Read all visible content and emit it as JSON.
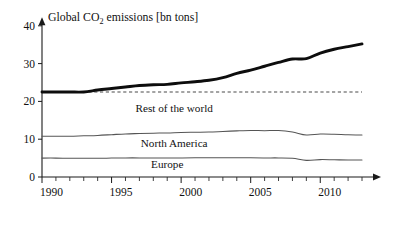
{
  "chart_data": {
    "type": "line",
    "title": "Global CO2 emissions [bn tons]",
    "title_prefix": "Global CO",
    "title_subscript": "2",
    "title_suffix": " emissions [bn tons]",
    "xlabel": "",
    "ylabel": "",
    "xlim": [
      1990,
      2013
    ],
    "ylim": [
      0,
      42
    ],
    "yticks": [
      0,
      10,
      20,
      30,
      40
    ],
    "ytick_labels": [
      "0",
      "10",
      "20",
      "30",
      "40"
    ],
    "xticks": [
      1990,
      1995,
      2000,
      2005,
      2010
    ],
    "xtick_labels": [
      "1990",
      "1995",
      "2000",
      "2005",
      "2010"
    ],
    "minor_xtick_interval": 1,
    "grid": false,
    "legend": "inline-band-labels",
    "x": [
      1990,
      1991,
      1992,
      1993,
      1994,
      1995,
      1996,
      1997,
      1998,
      1999,
      2000,
      2001,
      2002,
      2003,
      2004,
      2005,
      2006,
      2007,
      2008,
      2009,
      2010,
      2011,
      2012,
      2013
    ],
    "series": [
      {
        "name": "Global total",
        "style": "bold",
        "color": "#0d0d0d",
        "values": [
          22.5,
          22.5,
          22.5,
          22.5,
          23.0,
          23.4,
          23.8,
          24.2,
          24.4,
          24.5,
          24.9,
          25.2,
          25.6,
          26.3,
          27.4,
          28.3,
          29.3,
          30.3,
          31.2,
          31.3,
          32.8,
          33.8,
          34.5,
          35.2
        ]
      },
      {
        "name": "Rest of the world (upper boundary: North America top)",
        "style": "thin",
        "color": "#555555",
        "values": [
          10.8,
          10.8,
          10.8,
          10.9,
          11.0,
          11.2,
          11.4,
          11.5,
          11.6,
          11.65,
          11.8,
          11.85,
          11.9,
          12.05,
          12.2,
          12.3,
          12.25,
          12.3,
          11.9,
          11.1,
          11.35,
          11.3,
          11.15,
          11.1
        ]
      },
      {
        "name": "Europe (upper boundary)",
        "style": "thin",
        "color": "#555555",
        "values": [
          5.0,
          5.0,
          4.95,
          4.95,
          4.95,
          5.0,
          5.05,
          5.05,
          5.05,
          5.05,
          5.05,
          5.1,
          5.1,
          5.1,
          5.1,
          5.1,
          5.05,
          5.05,
          4.95,
          4.4,
          4.6,
          4.55,
          4.5,
          4.5
        ]
      }
    ],
    "reference_line": {
      "name": "baseline-1990",
      "value": 22.5,
      "style": "dashed",
      "color": "#4a4a4a"
    },
    "band_labels": [
      {
        "text": "Rest of the world",
        "x": 1999.5,
        "y": 17.2
      },
      {
        "text": "North America",
        "x": 1999.5,
        "y": 8.0
      },
      {
        "text": "Europe",
        "x": 1999.0,
        "y": 2.4
      }
    ]
  }
}
